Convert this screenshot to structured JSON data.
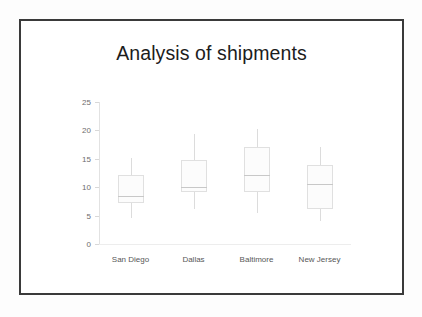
{
  "slide": {
    "title": "Analysis of shipments"
  },
  "chart_data": {
    "type": "box",
    "title": "Analysis of shipments",
    "xlabel": "",
    "ylabel": "",
    "ylim": [
      0,
      25
    ],
    "yticks": [
      0,
      5,
      10,
      15,
      20,
      25
    ],
    "ytick_labels": [
      "0",
      "5",
      "10",
      "15",
      "20",
      "25"
    ],
    "grid": false,
    "legend": "none",
    "categories": [
      "San Diego",
      "Dallas",
      "Baltimore",
      "New Jersey"
    ],
    "boxes": [
      {
        "category": "San Diego",
        "whisker_low": 4.6,
        "q1": 7.2,
        "median": 8.5,
        "q3": 12.1,
        "whisker_high": 15.1
      },
      {
        "category": "Dallas",
        "whisker_low": 6.2,
        "q1": 9.2,
        "median": 10.0,
        "q3": 14.8,
        "whisker_high": 19.4
      },
      {
        "category": "Baltimore",
        "whisker_low": 5.5,
        "q1": 9.2,
        "median": 12.1,
        "q3": 17.1,
        "whisker_high": 20.2
      },
      {
        "category": "New Jersey",
        "whisker_low": 4.0,
        "q1": 6.2,
        "median": 10.6,
        "q3": 13.9,
        "whisker_high": 17.1
      }
    ],
    "colors": {
      "box_fill": "#fcfcfc",
      "box_border": "#e0e0e0",
      "median": "#c8c8c8",
      "whisker": "#dcdcdc",
      "axis": "#e2e2e2",
      "tick_text": "#6d6d6d",
      "title_text": "#1c1c1c",
      "frame": "#3a3a3a"
    }
  }
}
